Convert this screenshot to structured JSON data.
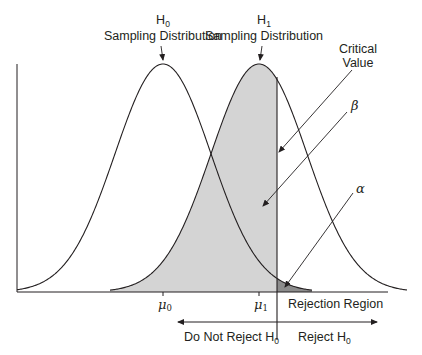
{
  "chart_data": {
    "type": "diagram",
    "distributions": [
      {
        "name": "H0 Sampling Distribution",
        "mean_label": "μ0",
        "shaded": false
      },
      {
        "name": "H1 Sampling Distribution",
        "mean_label": "μ1",
        "shaded": true,
        "fill": "#d4d4d4"
      }
    ],
    "regions": [
      {
        "name": "beta",
        "label": "β",
        "description": "Area of H1 left of critical value",
        "fill": "#d4d4d4"
      },
      {
        "name": "alpha",
        "label": "α",
        "description": "Area of H0 right of critical value",
        "fill": "#8c8c8c"
      }
    ],
    "critical_value_label": "Critical Value"
  },
  "labels": {
    "h0": {
      "main": "H",
      "sub": "0",
      "caption": "Sampling Distribution"
    },
    "h1": {
      "main": "H",
      "sub": "1",
      "caption": "Sampling Distribution"
    },
    "critical_line1": "Critical",
    "critical_line2": "Value",
    "beta": "β",
    "alpha": "α",
    "mu0": {
      "main": "μ",
      "sub": "0"
    },
    "mu1": {
      "main": "μ",
      "sub": "1"
    },
    "rejection_region": "Rejection Region",
    "do_not_reject": {
      "main": "Do Not Reject H",
      "sub": "0"
    },
    "reject": {
      "main": "Reject H",
      "sub": "0"
    }
  },
  "colors": {
    "line": "#231f20",
    "beta_fill": "#d4d4d4",
    "alpha_fill": "#8c8c8c"
  }
}
